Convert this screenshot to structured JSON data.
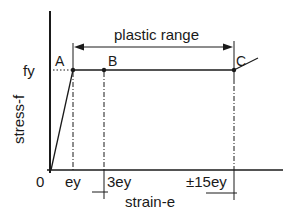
{
  "diagram": {
    "title_annotation": "plastic range",
    "axes": {
      "x_label": "strain-e",
      "y_label": "stress-f",
      "origin_label": "0"
    },
    "y_ticks": [
      {
        "label": "fy"
      }
    ],
    "x_ticks": [
      {
        "label": "ey"
      },
      {
        "label": "3ey"
      },
      {
        "label": "±15ey"
      }
    ],
    "points": [
      {
        "label": "A"
      },
      {
        "label": "B"
      },
      {
        "label": "C"
      }
    ],
    "colors": {
      "line": "#1a1a1a",
      "background": "#ffffff"
    }
  }
}
